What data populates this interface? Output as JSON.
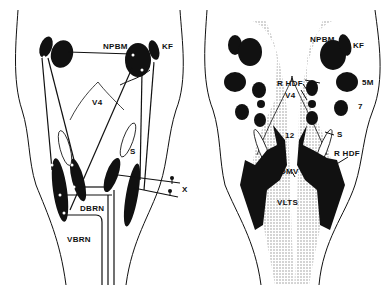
{
  "figure": {
    "panels": [
      {
        "id": "left",
        "description": "Schematic of brainstem connections (dorsal view) with projection pathways",
        "labels": {
          "npbm": "NPBM",
          "kf": "KF",
          "v4": "V4",
          "s": "S",
          "x": "X",
          "dbrn": "DBRN",
          "vbrn": "VBRN"
        }
      },
      {
        "id": "right",
        "description": "Schematic of brainstem nuclei distribution (dorsal view) with stippled regions",
        "labels": {
          "npbm": "NPBM",
          "kf": "KF",
          "fivem": "5M",
          "seven": "7",
          "rhdf_top": "R HDF",
          "v4": "V4",
          "twelve": "12",
          "s": "S",
          "rhdf_bottom": "R HDF",
          "dmv": "DMV",
          "vlts": "VLTS"
        }
      }
    ],
    "colors": {
      "ink": "#111111",
      "background": "#ffffff",
      "stipple": "#b8b8b8"
    }
  }
}
